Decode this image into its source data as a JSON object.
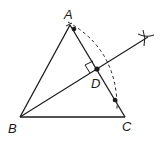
{
  "diagram": {
    "type": "geometry-construction",
    "points": {
      "A": {
        "label": "A",
        "x": 70,
        "y": 25
      },
      "B": {
        "label": "B",
        "x": 20,
        "y": 117
      },
      "C": {
        "label": "C",
        "x": 125,
        "y": 117
      },
      "D": {
        "label": "D",
        "x": 97,
        "y": 69
      }
    },
    "labels": {
      "A": "A",
      "B": "B",
      "C": "C",
      "D": "D"
    },
    "segments": [
      "AB",
      "BC",
      "AC",
      "BD extended to arc mark"
    ],
    "marks": {
      "right_angle_at": "D",
      "arc_intersection_mark": "×",
      "construction_points_on_AC": 2
    },
    "colors": {
      "stroke": "#1a1a1a",
      "background": "#ffffff"
    }
  }
}
